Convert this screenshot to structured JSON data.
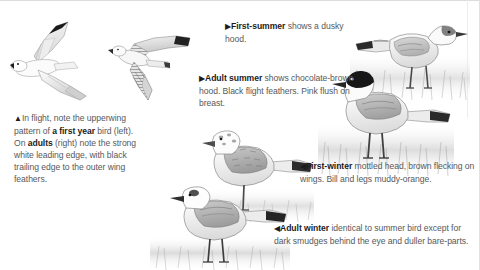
{
  "page": {
    "background_color": "#ffffff",
    "text_color": "#55595c",
    "bold_color": "#1c1c1c"
  },
  "markers": {
    "up": "▲",
    "right": "▶",
    "left": "◀"
  },
  "captions": [
    {
      "id": "flight",
      "marker": "▲",
      "lead": "In flight,",
      "full_text": "▲ In flight, note the upperwing pattern of a first year bird (left). On adults (right) note the strong white leading edge, with black trailing edge to the outer wing feathers.",
      "segments": {
        "s1": "In flight, note the upperwing pattern of ",
        "b1": "a first year",
        "s2": " bird (left). On ",
        "b2": "adults",
        "s3": " (right) note the strong white leading edge, with black trailing edge to the outer wing feathers."
      }
    },
    {
      "id": "first-summer",
      "marker": "▶",
      "full_text": "▶ First-summer shows a dusky hood.",
      "segments": {
        "b1": "First-summer",
        "s1": " shows a dusky hood."
      }
    },
    {
      "id": "adult-summer",
      "marker": "▶",
      "full_text": "▶ Adult summer shows chocolate-brown hood. Black flight feathers. Pink flush on breast.",
      "segments": {
        "b1": "Adult summer",
        "s1": " shows chocolate-brown hood. Black flight feathers. Pink flush on breast."
      }
    },
    {
      "id": "first-winter",
      "marker": "◀",
      "full_text": "◀ First-winter mottled head, brown flecking on wings. Bill and legs muddy-orange.",
      "segments": {
        "b1": "First-winter",
        "s1": " mottled head, brown flecking on wings. Bill and legs muddy-orange."
      }
    },
    {
      "id": "adult-winter",
      "marker": "◀",
      "full_text": "◀ Adult winter identical to summer bird except for dark smudges behind the eye and duller bare-parts.",
      "segments": {
        "b1": "Adult winter",
        "s1": " identical to summer bird except for dark smudges behind the eye and duller bare-parts."
      }
    }
  ],
  "illustrations": [
    {
      "id": "flight-adult",
      "name": "gull-in-flight-adult",
      "description": "Adult gull in flight, white wings with black trailing edge on outer wing feathers"
    },
    {
      "id": "flight-first",
      "name": "gull-in-flight-first-year",
      "description": "First year gull in flight, brown barred upperwing pattern"
    },
    {
      "id": "first-summer",
      "name": "gull-standing-first-summer",
      "description": "First-summer gull standing, dusky partial hood, dark tail band"
    },
    {
      "id": "adult-summer",
      "name": "gull-standing-adult-summer",
      "description": "Adult summer gull standing, chocolate-brown hood, pink flush on breast"
    },
    {
      "id": "first-winter",
      "name": "gull-standing-first-winter",
      "description": "First-winter gull standing on one leg, mottled head and brown flecked wings"
    },
    {
      "id": "adult-winter",
      "name": "gull-standing-adult-winter",
      "description": "Adult winter gull standing, dark smudge behind eye, white head"
    }
  ]
}
